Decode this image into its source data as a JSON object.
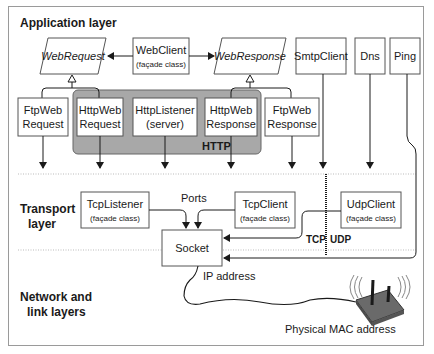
{
  "layers": {
    "application": "Application layer",
    "transport_line1": "Transport",
    "transport_line2": "layer",
    "network_line1": "Network and",
    "network_line2": "link layers"
  },
  "application_classes": {
    "web_request": "WebRequest",
    "web_client": "WebClient",
    "web_client_sub": "(façade class)",
    "web_response": "WebResponse",
    "smtp_client": "SmtpClient",
    "dns": "Dns",
    "ping": "Ping",
    "ftp_web_request_1": "FtpWeb",
    "ftp_web_request_2": "Request",
    "http_web_request_1": "HttpWeb",
    "http_web_request_2": "Request",
    "http_listener_1": "HttpListener",
    "http_listener_2": "(server)",
    "http_web_response_1": "HttpWeb",
    "http_web_response_2": "Response",
    "ftp_web_response_1": "FtpWeb",
    "ftp_web_response_2": "Response",
    "http_group": "HTTP"
  },
  "transport_classes": {
    "tcp_listener": "TcpListener",
    "tcp_listener_sub": "(façade class)",
    "ports": "Ports",
    "tcp_client": "TcpClient",
    "tcp_client_sub": "(façade class)",
    "udp_client": "UdpClient",
    "udp_client_sub": "(façade class)",
    "socket": "Socket",
    "tcp": "TCP",
    "udp": "UDP"
  },
  "network": {
    "ip_address": "IP address",
    "mac_address": "Physical MAC address"
  },
  "colors": {
    "http_group_fill": "#a8a8a8",
    "box_stroke": "#555555",
    "frame_stroke": "#9a9a9a",
    "text": "#1a1a1a"
  }
}
